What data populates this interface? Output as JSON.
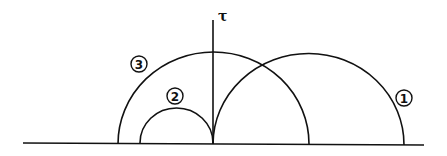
{
  "diagram": {
    "axis_label": "τ",
    "curves": [
      {
        "id": "1",
        "label": "1"
      },
      {
        "id": "2",
        "label": "2"
      },
      {
        "id": "3",
        "label": "3"
      }
    ]
  }
}
